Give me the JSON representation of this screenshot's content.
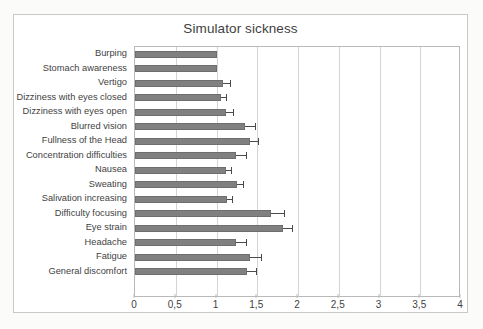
{
  "chart_data": {
    "type": "bar",
    "orientation": "horizontal",
    "title": "Simulator sickness",
    "xlabel": "",
    "ylabel": "",
    "xlim": [
      0,
      4
    ],
    "xticks": [
      "0",
      "0,5",
      "1",
      "1,5",
      "2",
      "2,5",
      "3",
      "3,5",
      "4"
    ],
    "xtick_values": [
      0,
      0.5,
      1,
      1.5,
      2,
      2.5,
      3,
      3.5,
      4
    ],
    "grid": true,
    "legend": "none",
    "bar_color": "#808080",
    "errorbar_color": "#4a4a4a",
    "categories": [
      "Burping",
      "Stomach awareness",
      "Vertigo",
      "Dizziness with eyes closed",
      "Dizziness with eyes open",
      "Blurred vision",
      "Fullness of the Head",
      "Concentration difficulties",
      "Nausea",
      "Sweating",
      "Salivation increasing",
      "Difficulty focusing",
      "Eye strain",
      "Headache",
      "Fatigue",
      "General discomfort"
    ],
    "values": [
      1.0,
      1.0,
      1.08,
      1.06,
      1.12,
      1.35,
      1.41,
      1.24,
      1.12,
      1.25,
      1.13,
      1.67,
      1.81,
      1.24,
      1.41,
      1.37
    ],
    "errors": [
      0.0,
      0.0,
      0.08,
      0.06,
      0.08,
      0.12,
      0.1,
      0.12,
      0.06,
      0.08,
      0.06,
      0.16,
      0.12,
      0.12,
      0.14,
      0.11
    ]
  }
}
